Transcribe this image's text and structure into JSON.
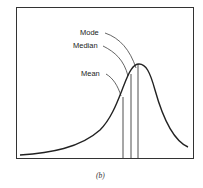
{
  "figure": {
    "caption": "(b)",
    "labels": {
      "mode": "Mode",
      "median": "Median",
      "mean": "Mean"
    },
    "colors": {
      "line": "#222222",
      "frame": "#333333",
      "background": "#ffffff"
    }
  }
}
